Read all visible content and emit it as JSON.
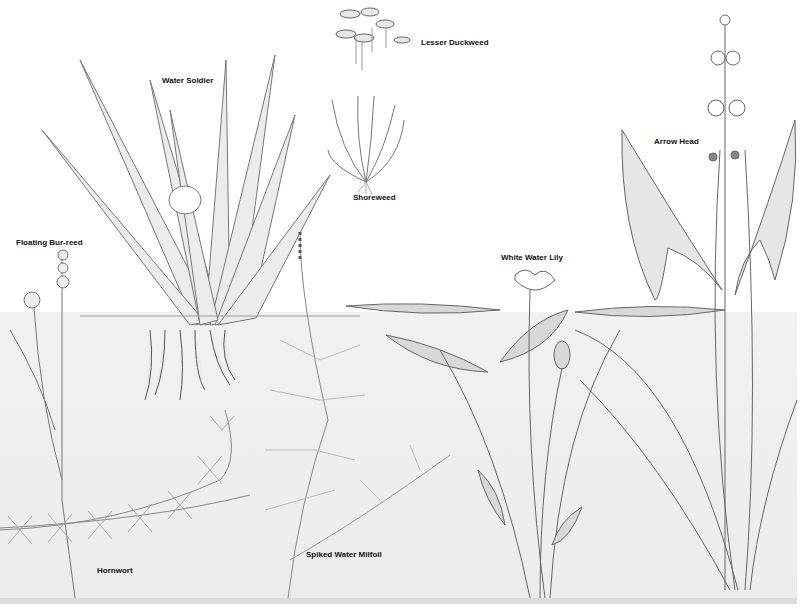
{
  "illustration": {
    "subject": "Freshwater pond plants",
    "colors": {
      "water": "#eeeeee",
      "ink": "#555555",
      "background": "#ffffff"
    },
    "labels": [
      {
        "id": "lesser-duckweed",
        "text": "Lesser Duckweed",
        "x": 421,
        "y": 38
      },
      {
        "id": "water-soldier",
        "text": "Water Soldier",
        "x": 162,
        "y": 76
      },
      {
        "id": "shoreweed",
        "text": "Shoreweed",
        "x": 353,
        "y": 193
      },
      {
        "id": "arrow-head",
        "text": "Arrow Head",
        "x": 654,
        "y": 137
      },
      {
        "id": "floating-bur-reed",
        "text": "Floating Bur-reed",
        "x": 16,
        "y": 238
      },
      {
        "id": "white-water-lily",
        "text": "White Water Lily",
        "x": 501,
        "y": 253
      },
      {
        "id": "spiked-water-milfoil",
        "text": "Spiked Water Milfoil",
        "x": 306,
        "y": 550
      },
      {
        "id": "hornwort",
        "text": "Hornwort",
        "x": 97,
        "y": 566
      }
    ]
  }
}
